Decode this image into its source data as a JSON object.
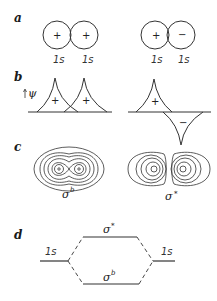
{
  "panels": {
    "a": {
      "label": "a",
      "bonding": {
        "left_sign": "+",
        "right_sign": "+",
        "left_orbital": "1s",
        "right_orbital": "1s",
        "overlap": "hatched"
      },
      "antibonding": {
        "left_sign": "+",
        "right_sign": "−",
        "left_orbital": "1s",
        "right_orbital": "1s"
      }
    },
    "b": {
      "label": "b",
      "axis_label": "ψ",
      "bonding": {
        "left_sign": "+",
        "right_sign": "+"
      },
      "antibonding": {
        "upper_sign": "+",
        "lower_sign": "−"
      }
    },
    "c": {
      "label": "c",
      "bonding_label": "σ",
      "bonding_sup": "b",
      "antibonding_label": "σ",
      "antibonding_sup": "*"
    },
    "d": {
      "label": "d",
      "left_level": "1s",
      "right_level": "1s",
      "upper_level": "σ",
      "upper_sup": "*",
      "lower_level": "σ",
      "lower_sup": "b"
    }
  },
  "colors": {
    "line": "#333333",
    "background": "#ffffff"
  }
}
